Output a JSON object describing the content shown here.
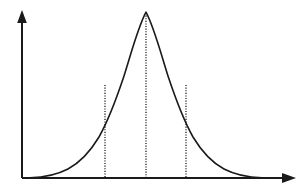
{
  "figure": {
    "name": "bell-curve-figure",
    "background_color": "#ffffff",
    "ink_color": "#1a1a1a",
    "width": 306,
    "height": 191
  },
  "axes": {
    "origin": {
      "x": 22,
      "y": 178
    },
    "y_axis": {
      "name": "y-axis",
      "x": 22,
      "top": 11,
      "bottom": 178,
      "arrow": "up-arrow-icon",
      "label": ""
    },
    "x_axis": {
      "name": "x-axis",
      "y": 178,
      "left": 22,
      "right": 295,
      "arrow": "right-arrow-icon",
      "label": ""
    }
  },
  "markers": [
    {
      "name": "marker-minus-sigma",
      "x": 105,
      "top_y": 85,
      "bottom_y": 178,
      "style": "dotted",
      "label": ""
    },
    {
      "name": "marker-mean",
      "x": 146,
      "top_y": 13,
      "bottom_y": 178,
      "style": "dotted",
      "label": ""
    },
    {
      "name": "marker-plus-sigma",
      "x": 186,
      "top_y": 85,
      "bottom_y": 178,
      "style": "dotted",
      "label": ""
    }
  ],
  "chart_data": {
    "type": "line",
    "title": "",
    "subtitle": "",
    "xlabel": "",
    "ylabel": "",
    "grid": false,
    "legend": null,
    "distribution": "normal",
    "mean": 146,
    "std_dev": 40,
    "peak": {
      "x": 146,
      "y": 12
    },
    "baseline_y": 178,
    "xlim": [
      22,
      295
    ],
    "ylim": [
      178,
      11
    ],
    "annotations": [
      {
        "kind": "vertical-dotted-line",
        "x": 105,
        "meaning": "mean-minus-one-sigma"
      },
      {
        "kind": "vertical-dotted-line",
        "x": 146,
        "meaning": "mean"
      },
      {
        "kind": "vertical-dotted-line",
        "x": 186,
        "meaning": "mean-plus-one-sigma"
      }
    ],
    "x": [
      30,
      40,
      50,
      60,
      70,
      80,
      90,
      100,
      105,
      110,
      120,
      130,
      140,
      146,
      150,
      160,
      170,
      180,
      186,
      190,
      200,
      210,
      220,
      230,
      240,
      250,
      260,
      270
    ],
    "values": [
      177.6,
      177.0,
      175.6,
      172.5,
      166.8,
      157.3,
      143.5,
      125.8,
      115.9,
      105.9,
      87.2,
      62.4,
      30.6,
      12.0,
      30.6,
      62.4,
      87.2,
      105.9,
      115.9,
      125.8,
      143.5,
      157.3,
      166.8,
      172.5,
      175.6,
      177.0,
      177.6,
      177.9
    ],
    "curve_path": "M 30,177.8 C 44,177.4 56,175.2 68,169.0 C 80,162.5 90,152.0 99,137.0 C 108,121.0 116,100.0 124,76.0 C 131,54.0 138,27.0 146,12.2 C 154,27.0 161,54.0 168,76.0 C 176,100.0 184,121.0 193,137.0 C 202,152.0 212,162.5 224,169.0 C 236,175.2 248,177.4 262,177.8"
  }
}
